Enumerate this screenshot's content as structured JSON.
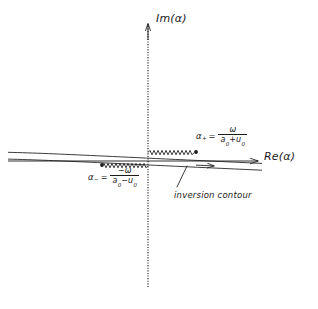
{
  "figure": {
    "background_color": "#ffffff",
    "ink_color": "#1a1a1a",
    "width": 318,
    "height": 309
  },
  "axes": {
    "real": {
      "label": "Re(α)",
      "icon": "arrow-right-icon",
      "y": 161,
      "x_start": 8,
      "x_end": 262
    },
    "imaginary": {
      "label": "Im(α)",
      "icon": "arrow-up-icon",
      "x": 148,
      "y_top": 22,
      "y_bottom": 287,
      "style": "dotted"
    },
    "origin": {
      "x": 148,
      "y": 161
    }
  },
  "branch_points": [
    {
      "name": "alpha-plus",
      "symbol": "α",
      "subscript": "+",
      "equals": "=",
      "numerator": "ω",
      "denominator_a": "a",
      "denominator_a_sub": "0",
      "denominator_op": "+",
      "denominator_u": "u",
      "denominator_u_sub": "0",
      "value_text": "α₊ = ω / (a₀ + u₀)",
      "dot": {
        "x": 196,
        "y": 152
      }
    },
    {
      "name": "alpha-minus",
      "symbol": "α",
      "subscript": "−",
      "equals": "=",
      "numerator": "−ω",
      "denominator_a": "a",
      "denominator_a_sub": "0",
      "denominator_op": "−",
      "denominator_u": "u",
      "denominator_u_sub": "0",
      "value_text": "α₋ = −ω / (a₀ − u₀)",
      "dot": {
        "x": 102,
        "y": 165
      }
    }
  ],
  "branch_cuts": [
    {
      "name": "branch-cut-right",
      "style": "zigzag",
      "from": {
        "x": 148,
        "y": 152
      },
      "to": {
        "x": 196,
        "y": 152
      }
    },
    {
      "name": "branch-cut-left",
      "style": "zigzag",
      "from": {
        "x": 102,
        "y": 165
      },
      "to": {
        "x": 148,
        "y": 165
      }
    }
  ],
  "contour": {
    "annotation": "inversion contour",
    "direction_icon": "arrow-right-icon",
    "arrow_at": {
      "x": 212,
      "y": 166
    },
    "leader_line": {
      "x1": 186,
      "y1": 166,
      "x2": 176,
      "y2": 187
    },
    "upper_line": {
      "x1": 8,
      "y1": 152,
      "x2": 262,
      "y2": 163
    },
    "lower_line": {
      "x1": 8,
      "y1": 159,
      "x2": 262,
      "y2": 170
    }
  }
}
